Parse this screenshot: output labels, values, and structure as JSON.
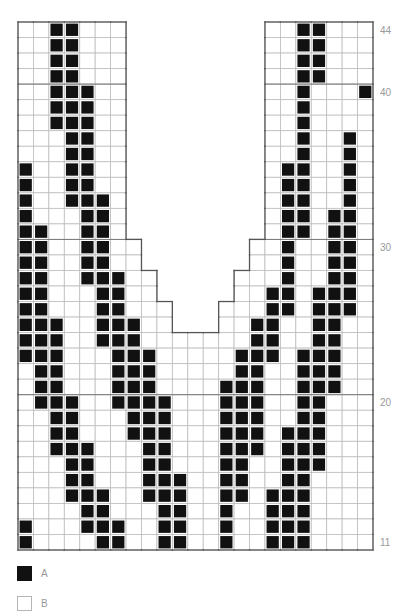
{
  "chart_title": "",
  "chart_data": {
    "type": "table",
    "columns": 23,
    "row_range": [
      11,
      44
    ],
    "row_labels": [
      "44",
      "40",
      "30",
      "20",
      "11"
    ],
    "colors": {
      "A": "#111111",
      "B": "#ffffff",
      "grid": "#bdbdbd",
      "outline": "#555555"
    },
    "grid_extent_by_rows": [
      {
        "rows": [
          31,
          44
        ],
        "segments": [
          [
            0,
            6
          ],
          [
            16,
            22
          ]
        ]
      },
      {
        "rows": [
          29,
          30
        ],
        "segments": [
          [
            0,
            7
          ],
          [
            15,
            22
          ]
        ]
      },
      {
        "rows": [
          27,
          28
        ],
        "segments": [
          [
            0,
            8
          ],
          [
            14,
            22
          ]
        ]
      },
      {
        "rows": [
          25,
          26
        ],
        "segments": [
          [
            0,
            9
          ],
          [
            13,
            22
          ]
        ]
      },
      {
        "rows": [
          11,
          24
        ],
        "segments": [
          [
            0,
            22
          ]
        ]
      }
    ],
    "color_A_cells": {
      "44": [
        2,
        3,
        18,
        19
      ],
      "43": [
        2,
        3,
        18,
        19
      ],
      "42": [
        2,
        3,
        18,
        19
      ],
      "41": [
        2,
        3,
        18,
        19
      ],
      "40": [
        2,
        3,
        4,
        18,
        22
      ],
      "39": [
        2,
        3,
        4,
        18
      ],
      "38": [
        2,
        3,
        4,
        18
      ],
      "37": [
        3,
        4,
        18,
        21
      ],
      "36": [
        3,
        4,
        18,
        21
      ],
      "35": [
        0,
        3,
        4,
        17,
        18,
        21
      ],
      "34": [
        0,
        3,
        4,
        17,
        18,
        21
      ],
      "33": [
        0,
        3,
        4,
        5,
        17,
        18,
        21
      ],
      "32": [
        0,
        4,
        5,
        17,
        18,
        20,
        21
      ],
      "31": [
        0,
        1,
        4,
        5,
        17,
        18,
        20,
        21
      ],
      "30": [
        0,
        1,
        4,
        5,
        17,
        20,
        21
      ],
      "29": [
        0,
        1,
        4,
        5,
        17,
        20,
        21
      ],
      "28": [
        0,
        1,
        4,
        5,
        6,
        17,
        20,
        21
      ],
      "27": [
        0,
        1,
        5,
        6,
        16,
        17,
        19,
        20,
        21
      ],
      "26": [
        0,
        1,
        5,
        6,
        16,
        17,
        19,
        20,
        21
      ],
      "25": [
        0,
        1,
        2,
        5,
        6,
        7,
        15,
        16,
        19,
        20
      ],
      "24": [
        0,
        1,
        2,
        5,
        6,
        7,
        15,
        16,
        19,
        20
      ],
      "23": [
        0,
        1,
        2,
        6,
        7,
        8,
        14,
        15,
        16,
        18,
        19,
        20
      ],
      "22": [
        1,
        2,
        6,
        7,
        8,
        14,
        15,
        18,
        19,
        20
      ],
      "21": [
        1,
        2,
        6,
        7,
        8,
        13,
        14,
        15,
        18,
        19,
        20
      ],
      "20": [
        1,
        2,
        3,
        6,
        7,
        8,
        9,
        13,
        14,
        15,
        18,
        19
      ],
      "19": [
        2,
        3,
        7,
        8,
        9,
        13,
        14,
        15,
        18,
        19
      ],
      "18": [
        2,
        3,
        7,
        8,
        9,
        13,
        14,
        15,
        17,
        18,
        19
      ],
      "17": [
        2,
        3,
        4,
        8,
        9,
        13,
        14,
        15,
        17,
        18,
        19
      ],
      "16": [
        3,
        4,
        8,
        9,
        13,
        14,
        17,
        18,
        19
      ],
      "15": [
        3,
        4,
        8,
        9,
        10,
        13,
        14,
        17,
        18
      ],
      "14": [
        3,
        4,
        5,
        8,
        9,
        10,
        13,
        14,
        16,
        17,
        18
      ],
      "13": [
        4,
        5,
        9,
        10,
        13,
        16,
        17,
        18
      ],
      "12": [
        0,
        4,
        5,
        6,
        9,
        10,
        13,
        16,
        17,
        18
      ],
      "11": [
        0,
        5,
        6,
        9,
        10,
        13,
        16,
        17,
        18
      ]
    },
    "legend": [
      {
        "key": "A",
        "label": "A",
        "color": "#111111"
      },
      {
        "key": "B",
        "label": "B",
        "color": "#ffffff"
      }
    ]
  },
  "legend": {
    "a_label": "A",
    "b_label": "B"
  }
}
